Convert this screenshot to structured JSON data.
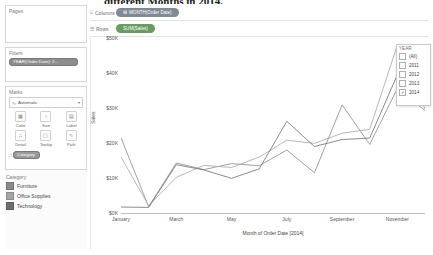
{
  "document": {
    "cutoff_title": "different Months in 2014."
  },
  "sidebar": {
    "pages": {
      "title": "Pages"
    },
    "filters": {
      "title": "Filters",
      "pill": "YEAR(Order Date): 2..."
    },
    "marks": {
      "title": "Marks",
      "mark_type": "Automatic",
      "mark_type_icon": "line-mark-icon",
      "caret": "▾",
      "buttons": [
        {
          "label": "Color",
          "icon": "color-icon",
          "glyph": "▦"
        },
        {
          "label": "Size",
          "icon": "size-icon",
          "glyph": "○"
        },
        {
          "label": "Label",
          "icon": "label-icon",
          "glyph": "▤"
        },
        {
          "label": "Detail",
          "icon": "detail-icon",
          "glyph": "∴"
        },
        {
          "label": "Tooltip",
          "icon": "tooltip-icon",
          "glyph": "▢"
        },
        {
          "label": "Path",
          "icon": "path-icon",
          "glyph": "∿"
        }
      ],
      "color_shelf_pill": "Category",
      "color_shelf_handle": "∷"
    },
    "legend": {
      "title": "Category",
      "items": [
        {
          "label": "Furniture",
          "color": "#8a8a8a"
        },
        {
          "label": "Office Supplies",
          "color": "#a6a6a6"
        },
        {
          "label": "Technology",
          "color": "#6f6f6f"
        }
      ]
    }
  },
  "shelves": {
    "columns": {
      "name": "Columns",
      "icon": "columns-icon",
      "glyph": "⌸",
      "pill": "MONTH(Order Date)",
      "pill_icon": "⊞"
    },
    "rows": {
      "name": "Rows",
      "icon": "rows-icon",
      "glyph": "☰",
      "pill": "SUM(Sales)",
      "pill_icon": ""
    }
  },
  "year_filter": {
    "title": "YEAR",
    "options": [
      {
        "label": "(All)",
        "checked": false
      },
      {
        "label": "2011",
        "checked": false
      },
      {
        "label": "2012",
        "checked": false
      },
      {
        "label": "2013",
        "checked": false
      },
      {
        "label": "2014",
        "checked": true
      }
    ],
    "check_glyph": "✓"
  },
  "chart_data": {
    "type": "line",
    "title": "",
    "xlabel": "Month of Order Date [2014]",
    "ylabel": "Sales",
    "grid": false,
    "legend_position": "left-sidebar",
    "categories": [
      "January",
      "February",
      "March",
      "April",
      "May",
      "June",
      "July",
      "August",
      "September",
      "October",
      "November",
      "December"
    ],
    "tick_labels_x": [
      "January",
      "March",
      "May",
      "July",
      "September",
      "November"
    ],
    "tick_labels_y": [
      "$0K",
      "$10K",
      "$20K",
      "$30K",
      "$40K",
      "$50K"
    ],
    "ylim": [
      0,
      50000
    ],
    "ytick_step": 10000,
    "series": [
      {
        "name": "Furniture",
        "color": "#8a8a8a",
        "values": [
          21500,
          1800,
          14300,
          12400,
          14100,
          13500,
          18000,
          11500,
          30900,
          19600,
          35600,
          29300
        ]
      },
      {
        "name": "Office Supplies",
        "color": "#a6a6a6",
        "values": [
          16000,
          2100,
          10200,
          13600,
          13000,
          16000,
          20800,
          19900,
          22800,
          23900,
          48000,
          29700
        ]
      },
      {
        "name": "Technology",
        "color": "#6f6f6f",
        "values": [
          1700,
          1600,
          13800,
          12300,
          9900,
          12600,
          26200,
          19000,
          21000,
          21400,
          39500,
          36200
        ]
      }
    ]
  }
}
